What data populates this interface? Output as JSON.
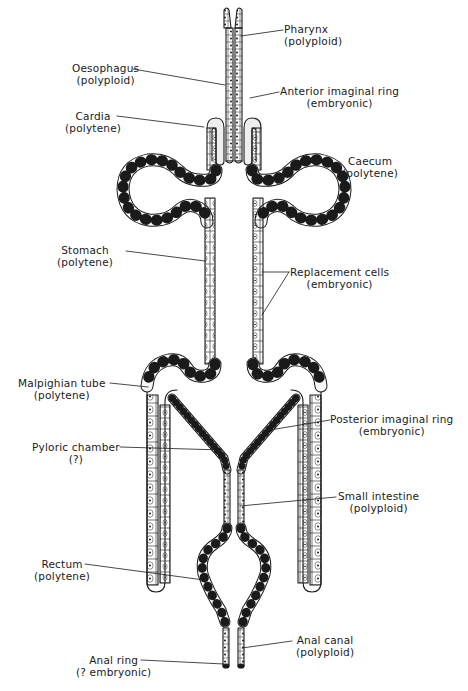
{
  "figure": {
    "labels": [
      {
        "id": "pharynx",
        "name": "Pharynx",
        "type": "(polyploid)"
      },
      {
        "id": "oesophagus",
        "name": "Oesophagus",
        "type": "(polyploid)"
      },
      {
        "id": "anterior-imaginal-ring",
        "name": "Anterior imaginal ring",
        "type": "(embryonic)"
      },
      {
        "id": "cardia",
        "name": "Cardia",
        "type": "(polytene)"
      },
      {
        "id": "caecum",
        "name": "Caecum",
        "type": "(polytene)"
      },
      {
        "id": "stomach",
        "name": "Stomach",
        "type": "(polytene)"
      },
      {
        "id": "replacement-cells",
        "name": "Replacement cells",
        "type": "(embryonic)"
      },
      {
        "id": "malpighian-tube",
        "name": "Malpighian tube",
        "type": "(polytene)"
      },
      {
        "id": "posterior-imaginal-ring",
        "name": "Posterior imaginal ring",
        "type": "(embryonic)"
      },
      {
        "id": "pyloric-chamber",
        "name": "Pyloric chamber",
        "type": "(?)"
      },
      {
        "id": "small-intestine",
        "name": "Small intestine",
        "type": "(polyploid)"
      },
      {
        "id": "rectum",
        "name": "Rectum",
        "type": "(polytene)"
      },
      {
        "id": "anal-canal",
        "name": "Anal canal",
        "type": "(polyploid)"
      },
      {
        "id": "anal-ring",
        "name": "Anal ring",
        "type": "(? embryonic)"
      }
    ]
  },
  "colors": {
    "ink": "#1a1a1a",
    "background": "#ffffff",
    "cell_fill": "#f4f4f4"
  }
}
